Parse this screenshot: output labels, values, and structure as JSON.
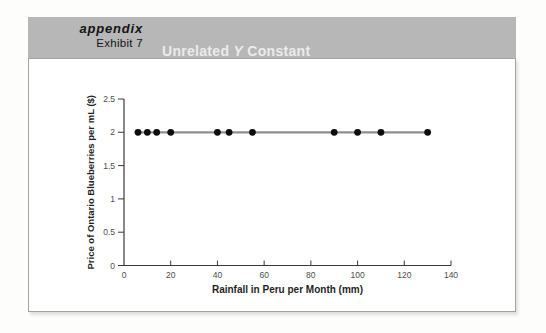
{
  "header": {
    "kicker": "appendix",
    "exhibit": "Exhibit 7",
    "title_pre": "Unrelated",
    "title_var": "Y",
    "title_post": "Constant",
    "bar_color": "#b7b7b7",
    "title_color": "#ebebeb"
  },
  "chart_data": {
    "type": "scatter",
    "xlabel": "Rainfall in Peru per Month (mm)",
    "ylabel": "Price of Ontario Blueberries per mL ($)",
    "x": [
      6,
      10,
      14,
      20,
      40,
      45,
      55,
      90,
      100,
      110,
      130
    ],
    "y": [
      2,
      2,
      2,
      2,
      2,
      2,
      2,
      2,
      2,
      2,
      2
    ],
    "xlim": [
      0,
      140
    ],
    "ylim": [
      0,
      2.5
    ],
    "xticks": [
      0,
      20,
      40,
      60,
      80,
      100,
      120,
      140
    ],
    "yticks": [
      0,
      0.5,
      1,
      1.5,
      2,
      2.5
    ],
    "grid": false,
    "legend": null,
    "trend_line": {
      "y": 2,
      "x_start": 6,
      "x_end": 130,
      "color": "#8f8f8f"
    },
    "dot_color": "#0d0d0d",
    "axis_color": "#3a3a3a"
  }
}
